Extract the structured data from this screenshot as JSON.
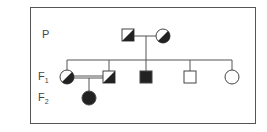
{
  "diagram": {
    "type": "pedigree",
    "generations": [
      {
        "label": "P"
      },
      {
        "label": "F1"
      },
      {
        "label": "F2"
      }
    ],
    "individuals": [
      {
        "id": "P-father",
        "sex": "male",
        "status": "carrier",
        "gen": "P"
      },
      {
        "id": "P-mother",
        "sex": "female",
        "status": "carrier",
        "gen": "P"
      },
      {
        "id": "F1-female-1",
        "sex": "female",
        "status": "carrier",
        "gen": "F1"
      },
      {
        "id": "F1-male-1",
        "sex": "male",
        "status": "carrier",
        "gen": "F1"
      },
      {
        "id": "F1-male-2",
        "sex": "male",
        "status": "affected",
        "gen": "F1"
      },
      {
        "id": "F1-male-3",
        "sex": "male",
        "status": "unaffected",
        "gen": "F1"
      },
      {
        "id": "F1-female-2",
        "sex": "female",
        "status": "unaffected",
        "gen": "F1"
      },
      {
        "id": "F2-female",
        "sex": "female",
        "status": "affected",
        "gen": "F2"
      }
    ],
    "unions": [
      {
        "partners": [
          "P-father",
          "P-mother"
        ],
        "consanguineous": false
      },
      {
        "partners": [
          "F1-female-1",
          "F1-male-1"
        ],
        "consanguineous": true
      }
    ],
    "colors": {
      "line": "#555555",
      "fill": "#222222"
    }
  }
}
